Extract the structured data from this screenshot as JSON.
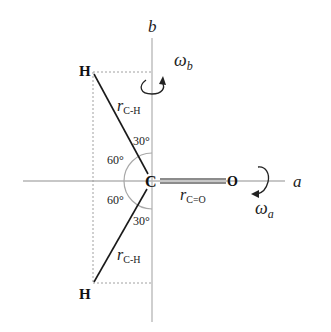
{
  "diagram": {
    "axes": {
      "a": {
        "label": "a",
        "rotation_label": "ω",
        "rotation_subscript": "a"
      },
      "b": {
        "label": "b",
        "rotation_label": "ω",
        "rotation_subscript": "b"
      }
    },
    "atoms": {
      "carbon": "C",
      "oxygen": "O",
      "hydrogen_top": "H",
      "hydrogen_bottom": "H"
    },
    "bonds": {
      "c_h_top": {
        "label_main": "r",
        "label_sub": "C-H"
      },
      "c_h_bottom": {
        "label_main": "r",
        "label_sub": "C-H"
      },
      "c_o": {
        "label_main": "r",
        "label_sub": "C=O"
      }
    },
    "angles": {
      "top_inner": "30°",
      "top_outer": "60°",
      "bottom_outer": "60°",
      "bottom_inner": "30°"
    },
    "colors": {
      "axis": "#b5b5b5",
      "bond": "#1a1a1a",
      "dashed": "#a0a0a0",
      "text": "#111111"
    }
  }
}
